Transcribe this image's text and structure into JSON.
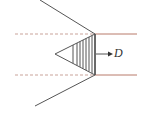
{
  "diagram": {
    "label_D": "D",
    "colors": {
      "stroke": "#555555",
      "dashed": "#c9a39a",
      "solid_red": "#b87a6a",
      "background": "#ffffff"
    },
    "geometry": {
      "upper_slant": {
        "x1": 40,
        "y1": 0,
        "x2": 95,
        "y2": 34
      },
      "lower_slant": {
        "x1": 35,
        "y1": 106,
        "x2": 95,
        "y2": 75
      },
      "upper_dashed": {
        "x1": 15,
        "y1": 34,
        "x2": 95,
        "y2": 34
      },
      "lower_dashed": {
        "x1": 15,
        "y1": 75,
        "x2": 95,
        "y2": 75
      },
      "upper_solid": {
        "x1": 95,
        "y1": 34,
        "x2": 137,
        "y2": 34
      },
      "lower_solid": {
        "x1": 95,
        "y1": 75,
        "x2": 137,
        "y2": 75
      },
      "triangle_apex": {
        "x": 55,
        "y": 54
      },
      "triangle_base_x": 95,
      "hatch_x": [
        73,
        77,
        80,
        83,
        86,
        89,
        92
      ],
      "arrow": {
        "x1": 96,
        "y1": 54,
        "x2": 112,
        "y2": 54
      }
    }
  }
}
